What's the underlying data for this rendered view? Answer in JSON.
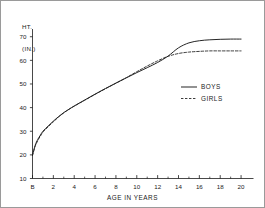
{
  "chart_data": {
    "type": "line",
    "title": "",
    "xlabel": "AGE IN YEARS",
    "ylabel": "HT.\n(IN.)",
    "ylabel_line1": "HT.",
    "ylabel_line2": "(IN.)",
    "xlim": [
      0,
      21
    ],
    "ylim": [
      10,
      72
    ],
    "grid": false,
    "legend_position": "center-right",
    "x_tick_labels": [
      "B",
      "2",
      "4",
      "6",
      "8",
      "10",
      "12",
      "14",
      "16",
      "18",
      "20"
    ],
    "x_tick_values": [
      0,
      2,
      4,
      6,
      8,
      10,
      12,
      14,
      16,
      18,
      20
    ],
    "x_minor_ticks": [
      1,
      3,
      5,
      7,
      9,
      11,
      13,
      15,
      17,
      19
    ],
    "y_tick_labels": [
      "10",
      "20",
      "30",
      "40",
      "50",
      "60",
      "70"
    ],
    "y_tick_values": [
      10,
      20,
      30,
      40,
      50,
      60,
      70
    ],
    "series": [
      {
        "name": "BOYS",
        "style": "solid",
        "color": "#1a1a1a",
        "x": [
          0,
          0.25,
          0.5,
          0.75,
          1,
          1.5,
          2,
          2.5,
          3,
          3.5,
          4,
          5,
          6,
          7,
          8,
          9,
          10,
          11,
          12,
          13,
          14,
          15,
          16,
          17,
          18,
          19,
          20
        ],
        "values": [
          20.0,
          24.0,
          26.5,
          28.3,
          30.0,
          32.2,
          34.3,
          36.2,
          37.9,
          39.3,
          40.7,
          43.2,
          45.7,
          48.1,
          50.4,
          52.6,
          54.8,
          56.9,
          59.1,
          61.8,
          65.3,
          67.4,
          68.3,
          68.7,
          68.9,
          69.0,
          69.0
        ]
      },
      {
        "name": "GIRLS",
        "style": "dashed",
        "color": "#1a1a1a",
        "x": [
          0,
          0.25,
          0.5,
          0.75,
          1,
          1.5,
          2,
          2.5,
          3,
          3.5,
          4,
          5,
          6,
          7,
          8,
          9,
          10,
          11,
          12,
          13,
          14,
          15,
          16,
          17,
          18,
          19,
          20
        ],
        "values": [
          19.7,
          23.5,
          26.0,
          27.9,
          29.6,
          31.9,
          34.0,
          36.0,
          37.8,
          39.3,
          40.6,
          43.1,
          45.6,
          48.0,
          50.3,
          52.7,
          55.2,
          57.6,
          59.8,
          61.7,
          62.9,
          63.5,
          63.8,
          64.0,
          64.0,
          64.0,
          64.0
        ]
      }
    ]
  },
  "legend": {
    "items": [
      {
        "label": "BOYS",
        "style": "solid"
      },
      {
        "label": "GIRLS",
        "style": "dashed"
      }
    ]
  }
}
